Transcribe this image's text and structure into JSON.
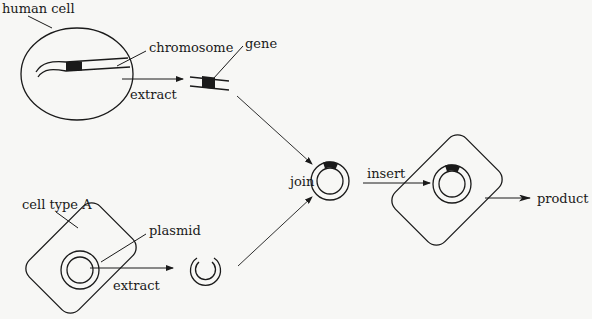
{
  "diagram": {
    "type": "genetic-engineering-flow",
    "labels": {
      "human_cell": "human cell",
      "chromosome": "chromosome",
      "extract_top": "extract",
      "gene": "gene",
      "cell_type_a": "cell type A",
      "plasmid": "plasmid",
      "extract_bottom": "extract",
      "join": "join",
      "insert": "insert",
      "product": "product"
    },
    "colors": {
      "stroke": "#1a1a1a",
      "background": "#f7f7f5"
    }
  }
}
